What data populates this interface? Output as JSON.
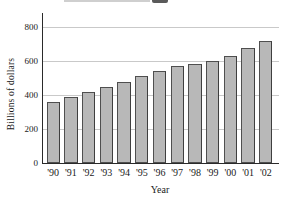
{
  "chart_data": {
    "type": "bar",
    "categories": [
      "'90",
      "'91",
      "'92",
      "'93",
      "'94",
      "'95",
      "'96",
      "'97",
      "'98",
      "'99",
      "'00",
      "'01",
      "'02"
    ],
    "values": [
      360,
      390,
      420,
      450,
      480,
      515,
      545,
      575,
      585,
      600,
      630,
      680,
      720
    ],
    "title": "",
    "xlabel": "Year",
    "ylabel": "Billions of dollars",
    "ylim": [
      0,
      890
    ],
    "yticks": [
      0,
      200,
      400,
      600,
      800
    ],
    "grid": true,
    "legend": "none",
    "colors": {
      "bar_fill": "#b8b8b8",
      "bar_border": "#4f4f4f",
      "gridline": "#c9c9c9",
      "axis": "#2a2a2a",
      "text": "#1a1a1a",
      "background": "#ffffff"
    }
  }
}
